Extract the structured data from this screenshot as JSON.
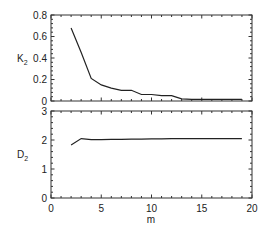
{
  "chart_data": [
    {
      "type": "line",
      "panel": "top",
      "ylabel": "K",
      "ylabel_sub": "2",
      "xlabel": "",
      "xlim": [
        0,
        20
      ],
      "ylim": [
        0,
        0.8
      ],
      "yticks": [
        0,
        0.2,
        0.4,
        0.6,
        0.8
      ],
      "ytick_labels": [
        "0",
        "0.2",
        "0.4",
        "0.6",
        "0.8"
      ],
      "grid": false,
      "series": [
        {
          "name": "K2",
          "x": [
            2,
            3,
            4,
            5,
            6,
            7,
            8,
            9,
            10,
            11,
            12,
            13,
            14,
            15,
            16,
            17,
            18,
            19
          ],
          "values": [
            0.68,
            0.45,
            0.21,
            0.15,
            0.12,
            0.1,
            0.1,
            0.06,
            0.06,
            0.05,
            0.05,
            0.02,
            0.015,
            0.015,
            0.015,
            0.015,
            0.015,
            0.015
          ]
        }
      ]
    },
    {
      "type": "line",
      "panel": "bottom",
      "ylabel": "D",
      "ylabel_sub": "2",
      "xlabel": "m",
      "xlim": [
        0,
        20
      ],
      "ylim": [
        0,
        3
      ],
      "yticks": [
        0,
        1,
        2,
        3
      ],
      "ytick_labels": [
        "0",
        "1",
        "2",
        "3"
      ],
      "xticks": [
        0,
        5,
        10,
        15,
        20
      ],
      "xtick_labels": [
        "0",
        "5",
        "10",
        "15",
        "20"
      ],
      "grid": false,
      "series": [
        {
          "name": "D2",
          "x": [
            2,
            3,
            4,
            5,
            6,
            7,
            8,
            9,
            10,
            11,
            12,
            13,
            14,
            15,
            16,
            17,
            18,
            19
          ],
          "values": [
            1.83,
            2.05,
            2.01,
            2.01,
            2.02,
            2.02,
            2.03,
            2.03,
            2.04,
            2.04,
            2.05,
            2.05,
            2.05,
            2.05,
            2.05,
            2.05,
            2.05,
            2.05
          ]
        }
      ]
    }
  ],
  "labels": {
    "top_ylabel": "K",
    "top_ylabel_sub": "2",
    "bottom_ylabel": "D",
    "bottom_ylabel_sub": "2",
    "xlabel": "m"
  },
  "colors": {
    "line": "#222222",
    "axis": "#333333"
  }
}
